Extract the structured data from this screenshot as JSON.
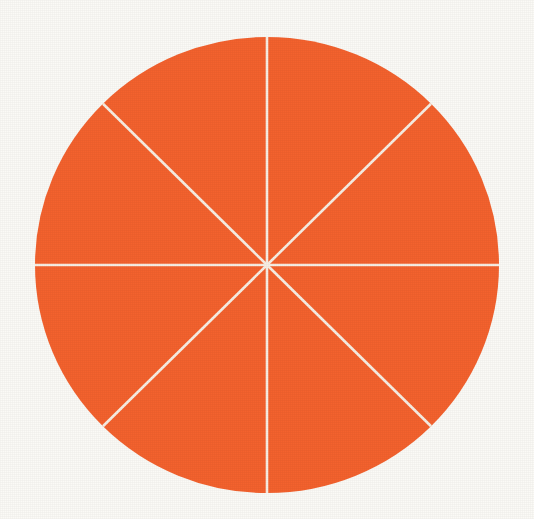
{
  "figure": {
    "shape": "circle",
    "background_color": "#FBFAF6",
    "fill_color": "#F4622E",
    "divider_color": "#F8EFE4",
    "divider_width_px": 2.6,
    "center_x": 267,
    "center_y": 265,
    "radius_x": 232,
    "radius_y": 228
  },
  "chart_data": {
    "type": "pie",
    "subtitle": "",
    "xlabel": "",
    "ylabel": "",
    "legend_position": "none",
    "grid": false,
    "labels_shown": false,
    "total_slices": 8,
    "shaded_slices": 8,
    "fraction": "8/8",
    "categories": [
      "Sector 1",
      "Sector 2",
      "Sector 3",
      "Sector 4",
      "Sector 5",
      "Sector 6",
      "Sector 7",
      "Sector 8"
    ],
    "values": [
      12.5,
      12.5,
      12.5,
      12.5,
      12.5,
      12.5,
      12.5,
      12.5
    ],
    "slice_angle_degrees": 45,
    "colors": [
      "#F4622E",
      "#F4622E",
      "#F4622E",
      "#F4622E",
      "#F4622E",
      "#F4622E",
      "#F4622E",
      "#F4622E"
    ],
    "divider_angles_degrees": [
      0,
      45,
      90,
      135,
      180,
      225,
      270,
      315
    ],
    "annotations": []
  },
  "slices": [
    {
      "name": "slice-1",
      "start_deg": -90,
      "end_deg": -45,
      "value": 12.5
    },
    {
      "name": "slice-2",
      "start_deg": -45,
      "end_deg": 0,
      "value": 12.5
    },
    {
      "name": "slice-3",
      "start_deg": 0,
      "end_deg": 45,
      "value": 12.5
    },
    {
      "name": "slice-4",
      "start_deg": 45,
      "end_deg": 90,
      "value": 12.5
    },
    {
      "name": "slice-5",
      "start_deg": 90,
      "end_deg": 135,
      "value": 12.5
    },
    {
      "name": "slice-6",
      "start_deg": 135,
      "end_deg": 180,
      "value": 12.5
    },
    {
      "name": "slice-7",
      "start_deg": 180,
      "end_deg": 225,
      "value": 12.5
    },
    {
      "name": "slice-8",
      "start_deg": 225,
      "end_deg": 270,
      "value": 12.5
    }
  ]
}
